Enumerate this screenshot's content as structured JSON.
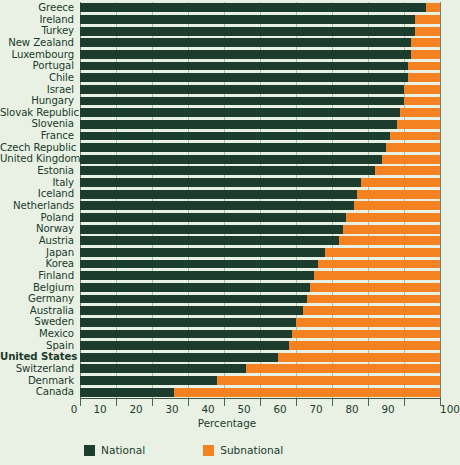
{
  "chart_data": {
    "type": "bar",
    "orientation": "horizontal",
    "stacked": true,
    "title": "",
    "xlabel": "Percentage",
    "ylabel": "",
    "xlim": [
      0,
      100
    ],
    "xticks": [
      0,
      10,
      20,
      30,
      40,
      50,
      60,
      70,
      80,
      90,
      100
    ],
    "grid": true,
    "legend_position": "bottom-left",
    "categories": [
      "Greece",
      "Ireland",
      "Turkey",
      "New Zealand",
      "Luxembourg",
      "Portugal",
      "Chile",
      "Israel",
      "Hungary",
      "Slovak Republic",
      "Slovenia",
      "France",
      "Czech Republic",
      "United Kingdom",
      "Estonia",
      "Italy",
      "Iceland",
      "Netherlands",
      "Poland",
      "Norway",
      "Austria",
      "Japan",
      "Korea",
      "Finland",
      "Belgium",
      "Germany",
      "Australia",
      "Sweden",
      "Mexico",
      "Spain",
      "United States",
      "Switzerland",
      "Denmark",
      "Canada"
    ],
    "highlighted_category": "United States",
    "series": [
      {
        "name": "National",
        "color": "#1c3d2e",
        "values": [
          96,
          93,
          93,
          92,
          92,
          91,
          91,
          90,
          90,
          89,
          88,
          86,
          85,
          84,
          82,
          78,
          77,
          76,
          74,
          73,
          72,
          68,
          66,
          65,
          64,
          63,
          62,
          60,
          59,
          58,
          55,
          46,
          38,
          26
        ]
      },
      {
        "name": "Subnational",
        "color": "#f58220",
        "values": [
          4,
          7,
          7,
          8,
          8,
          9,
          9,
          10,
          10,
          11,
          12,
          14,
          15,
          16,
          18,
          22,
          23,
          24,
          26,
          27,
          28,
          32,
          34,
          35,
          36,
          37,
          38,
          40,
          41,
          42,
          45,
          54,
          62,
          74
        ]
      }
    ]
  },
  "legend": {
    "items": [
      {
        "label": "National",
        "color": "#1c3d2e"
      },
      {
        "label": "Subnational",
        "color": "#f58220"
      }
    ]
  },
  "axis": {
    "x_title": "Percentage"
  },
  "colors": {
    "background": "#e9f1e5",
    "national": "#1c3d2e",
    "subnational": "#f58220",
    "gridline": "#788c78",
    "text": "#1b3b2c"
  }
}
